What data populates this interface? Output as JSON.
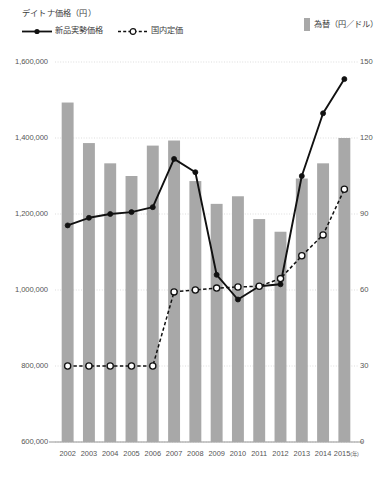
{
  "legend": {
    "left_title": "デイトナ価格（円）",
    "series": [
      {
        "label": "新品実勢価格",
        "marker": "solid-line-filled-circle",
        "color": "#111111"
      },
      {
        "label": "国内定価",
        "marker": "dashed-line-open-circle",
        "color": "#111111"
      }
    ],
    "right_label": "為替（円／ドル）",
    "right_swatch_color": "#a8a8a8"
  },
  "chart_data": {
    "type": "bar",
    "title": "デイトナ価格（円）",
    "xlabel": "(年)",
    "ylabel": "デイトナ価格（円）",
    "y2label": "為替（円／ドル）",
    "categories": [
      "2002",
      "2003",
      "2004",
      "2005",
      "2006",
      "2007",
      "2008",
      "2009",
      "2010",
      "2011",
      "2012",
      "2013",
      "2014",
      "2015"
    ],
    "ylim": [
      600000,
      1600000
    ],
    "yticks": [
      "600,000",
      "800,000",
      "1,000,000",
      "1,200,000",
      "1,400,000",
      "1,600,000"
    ],
    "ytick_values": [
      600000,
      800000,
      1000000,
      1200000,
      1400000,
      1600000
    ],
    "y2lim": [
      0,
      150
    ],
    "y2ticks": [
      "0",
      "30",
      "60",
      "90",
      "120",
      "150"
    ],
    "y2tick_values": [
      0,
      30,
      60,
      90,
      120,
      150
    ],
    "grid": true,
    "legend_position": "top",
    "series": [
      {
        "name": "為替（円／ドル）",
        "type": "bar",
        "axis": "right",
        "color": "#a8a8a8",
        "values": [
          134,
          118,
          110,
          105,
          117,
          119,
          103,
          94,
          97,
          88,
          83,
          104,
          110,
          120
        ]
      },
      {
        "name": "新品実勢価格",
        "type": "line",
        "axis": "left",
        "color": "#111111",
        "style": "solid",
        "marker": "filled-circle",
        "values": [
          1170000,
          1190000,
          1200000,
          1205000,
          1218000,
          1345000,
          1310000,
          1040000,
          975000,
          1010000,
          1015000,
          1300000,
          1465000,
          1555000
        ]
      },
      {
        "name": "国内定価",
        "type": "line",
        "axis": "left",
        "color": "#111111",
        "style": "dashed",
        "marker": "open-circle",
        "values": [
          800000,
          800000,
          800000,
          800000,
          800000,
          995000,
          1000000,
          1005000,
          1008000,
          1010000,
          1030000,
          1090000,
          1145000,
          1265000
        ]
      }
    ]
  }
}
